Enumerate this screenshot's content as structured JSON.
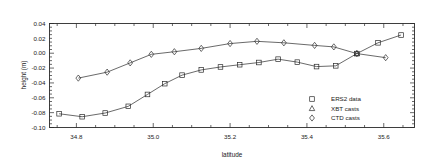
{
  "chart_data": {
    "type": "line",
    "title": "",
    "xlabel": "latitude",
    "ylabel": "height (m)",
    "xlim": [
      34.73,
      35.68
    ],
    "ylim": [
      -0.1,
      0.04
    ],
    "xticks": [
      34.8,
      35.0,
      35.2,
      35.4,
      35.6
    ],
    "xtick_labels": [
      "34.8",
      "35.0",
      "35.2",
      "35.4",
      "35.6"
    ],
    "yticks": [
      0.04,
      0.02,
      0.0,
      -0.02,
      -0.04,
      -0.06,
      -0.08,
      -0.1
    ],
    "ytick_labels": [
      "0.04",
      "0.02",
      "0.00",
      "-0.02",
      "-0.04",
      "-0.06",
      "-0.08",
      "-0.10"
    ],
    "grid": false,
    "legend_position": "lower-right",
    "series": [
      {
        "name": "ERS2 data",
        "marker": "square",
        "x": [
          34.755,
          34.815,
          34.875,
          34.935,
          34.985,
          35.03,
          35.075,
          35.125,
          35.175,
          35.225,
          35.275,
          35.325,
          35.375,
          35.425,
          35.475,
          35.53,
          35.585,
          35.645
        ],
        "y": [
          -0.0815,
          -0.0855,
          -0.0805,
          -0.0715,
          -0.0555,
          -0.041,
          -0.0295,
          -0.0225,
          -0.0185,
          -0.0155,
          -0.0125,
          -0.008,
          -0.012,
          -0.018,
          -0.017,
          -0.0005,
          0.014,
          0.0245
        ]
      },
      {
        "name": "XBT casts",
        "marker": "triangle",
        "x": [
          35.53
        ],
        "y": [
          -0.0005
        ]
      },
      {
        "name": "CTD casts",
        "marker": "diamond",
        "x": [
          34.805,
          34.88,
          34.94,
          34.995,
          35.055,
          35.125,
          35.2,
          35.27,
          35.34,
          35.42,
          35.47,
          35.53,
          35.605
        ],
        "y": [
          -0.0335,
          -0.0255,
          -0.013,
          -0.0015,
          0.002,
          0.0065,
          0.013,
          0.016,
          0.014,
          0.0105,
          0.0085,
          -0.0005,
          -0.006
        ]
      }
    ],
    "legend_entries": [
      {
        "label": "ERS2 data",
        "marker": "square"
      },
      {
        "label": "XBT casts",
        "marker": "triangle"
      },
      {
        "label": "CTD casts",
        "marker": "diamond"
      }
    ],
    "axis_color": "#2a2a2a"
  }
}
